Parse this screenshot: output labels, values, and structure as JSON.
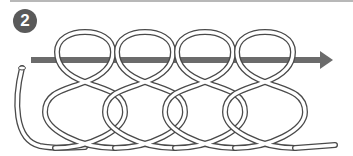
{
  "figure": {
    "step_number": "2",
    "loop_count": 4,
    "colors": {
      "arrow": "#6b6b6b",
      "badge": "#5a5a5a",
      "rope_outline": "#4a4a4a",
      "rope_fill": "#ffffff",
      "top_rule": "#b8b8b8"
    }
  }
}
